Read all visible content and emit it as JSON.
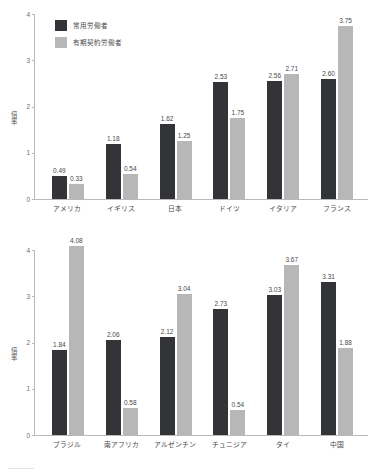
{
  "legend": {
    "series": [
      {
        "key": "regular",
        "label": "常用労働者",
        "color": "#333437"
      },
      {
        "key": "fixed_term",
        "label": "有期契約労働者",
        "color": "#b7b7b7"
      }
    ]
  },
  "axis": {
    "y_title": "倍率",
    "ticks": [
      "0",
      "1",
      "2",
      "3",
      "4"
    ]
  },
  "chart_data": [
    {
      "type": "bar",
      "title": "",
      "xlabel": "",
      "ylabel": "倍率",
      "ylim": [
        0,
        4
      ],
      "yticks": [
        0,
        1,
        2,
        3,
        4
      ],
      "grid": false,
      "legend_position": "top-left",
      "categories": [
        "アメリカ",
        "イギリス",
        "日本",
        "ドイツ",
        "イタリア",
        "フランス"
      ],
      "series": [
        {
          "name": "常用労働者",
          "color": "#333437",
          "values": [
            0.49,
            1.18,
            1.62,
            2.53,
            2.56,
            2.6
          ]
        },
        {
          "name": "有期契約労働者",
          "color": "#b7b7b7",
          "values": [
            0.33,
            0.54,
            1.25,
            1.75,
            2.71,
            3.75
          ]
        }
      ]
    },
    {
      "type": "bar",
      "title": "",
      "xlabel": "",
      "ylabel": "倍率",
      "ylim": [
        0,
        4
      ],
      "yticks": [
        0,
        1,
        2,
        3,
        4
      ],
      "grid": false,
      "legend_position": "none",
      "categories": [
        "ブラジル",
        "南アフリカ",
        "アルゼンチン",
        "チュニジア",
        "タイ",
        "中国"
      ],
      "series": [
        {
          "name": "常用労働者",
          "color": "#333437",
          "values": [
            1.84,
            2.06,
            2.12,
            2.73,
            3.03,
            3.31
          ]
        },
        {
          "name": "有期契約労働者",
          "color": "#b7b7b7",
          "values": [
            4.08,
            0.58,
            3.04,
            0.54,
            3.67,
            1.88
          ]
        }
      ]
    }
  ]
}
